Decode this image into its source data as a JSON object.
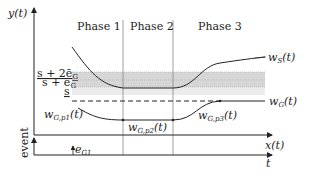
{
  "diagram": {
    "y_axis_label": "y(t)",
    "event_axis_label": "event",
    "x_axis_label": "x(t)",
    "t_axis_label": "t",
    "phases": [
      {
        "label": "Phase 1"
      },
      {
        "label": "Phase 2"
      },
      {
        "label": "Phase 3"
      }
    ],
    "band_labels": {
      "upper": "s + 2ē",
      "upper_sub": "G",
      "middle": "s + ē",
      "middle_sub": "G",
      "lower": "s"
    },
    "curves": {
      "ws": {
        "label": "w",
        "sub": "S",
        "arg": "(t)"
      },
      "wg": {
        "label": "w",
        "sub": "G",
        "arg": "(t)"
      },
      "wg_p1": {
        "label": "w",
        "sub": "G,p1",
        "arg": "(t)"
      },
      "wg_p2": {
        "label": "w",
        "sub": "G,p2",
        "arg": "(t)"
      },
      "wg_p3": {
        "label": "w",
        "sub": "G,p3",
        "arg": "(t)"
      }
    },
    "event_marker": {
      "label": "e",
      "sub": "G1"
    },
    "colors": {
      "band_dark": "#d4d4d4",
      "band_light": "#ebebeb",
      "line": "#222222",
      "divider": "#888888"
    }
  }
}
